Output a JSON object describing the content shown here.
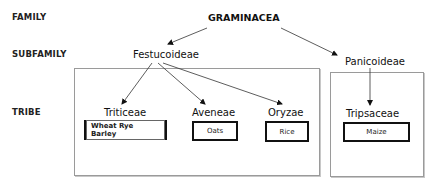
{
  "levels": {
    "family": "FAMILY",
    "subfamily": "SUBFAMILY",
    "tribe": "TRIBE"
  },
  "family": {
    "name": "GRAMINACEA"
  },
  "subfamilies": [
    {
      "name": "Festucoideae",
      "tribes": [
        {
          "name": "Triticeae",
          "members": "Wheat Rye Barley",
          "style": "hatched"
        },
        {
          "name": "Aveneae",
          "members": "Oats",
          "style": "plain"
        },
        {
          "name": "Oryzae",
          "members": "Rice",
          "style": "plain"
        }
      ]
    },
    {
      "name": "Panicoideae",
      "tribes": [
        {
          "name": "Tripsaceae",
          "members": "Maize",
          "style": "plain"
        }
      ]
    }
  ]
}
